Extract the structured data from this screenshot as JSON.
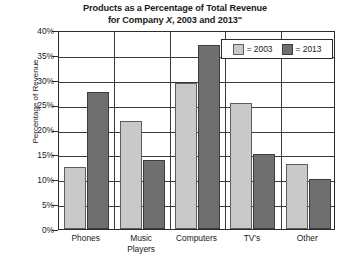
{
  "chart_data": {
    "type": "bar",
    "title": "Products as a Percentage of Total Revenue for Company X, 2003 and 2013\"",
    "title_line1": "Products as a Percentage of Total Revenue",
    "title_line2_pre": "for Company ",
    "title_line2_x": "X",
    "title_line2_post": ", 2003 and 2013\"",
    "xlabel": "",
    "ylabel": "Percentage of Revenue",
    "ylim": [
      0,
      40
    ],
    "ytick_labels": [
      "40%",
      "35%",
      "30%",
      "25%",
      "20%",
      "15%",
      "10%",
      "5%",
      "0%"
    ],
    "ytick_values": [
      40,
      35,
      30,
      25,
      20,
      15,
      10,
      5,
      0
    ],
    "grid": true,
    "legend_position": "top-right",
    "categories": [
      "Phones",
      "Music Players",
      "Computers",
      "TV's",
      "Other"
    ],
    "category_lines": [
      [
        "Phones"
      ],
      [
        "Music",
        "Players"
      ],
      [
        "Computers"
      ],
      [
        "TV's"
      ],
      [
        "Other"
      ]
    ],
    "series": [
      {
        "name": "2003",
        "legend_label": "= 2003",
        "color": "#c9c9c9",
        "values": [
          12.5,
          21.8,
          29.3,
          25.3,
          13.0
        ]
      },
      {
        "name": "2013",
        "legend_label": "= 2013",
        "color": "#6f6f6f",
        "values": [
          27.5,
          13.8,
          37.0,
          15.0,
          10.0
        ]
      }
    ]
  }
}
